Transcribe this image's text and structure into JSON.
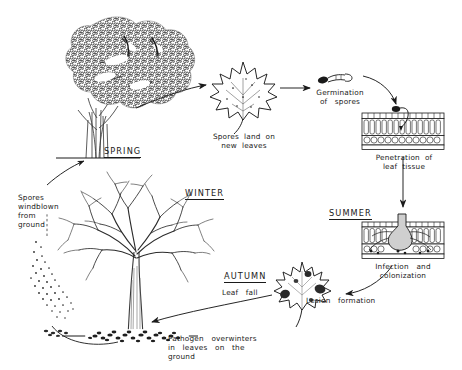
{
  "diagram": {
    "colors": {
      "ink": "#1a1a1a",
      "background": "#ffffff",
      "foliage": "#2b2b2b",
      "lesion": "#303030"
    }
  },
  "seasons": [
    {
      "id": "spring",
      "label": "SPRING"
    },
    {
      "id": "summer",
      "label": "SUMMER"
    },
    {
      "id": "autumn",
      "label": "AUTUMN"
    },
    {
      "id": "winter",
      "label": "WINTER"
    }
  ],
  "stages": [
    {
      "id": "spores-windblown",
      "label": "Spores\nwindblown\nfrom\nground",
      "icon": "spore-cloud-icon"
    },
    {
      "id": "spores-land",
      "label": "Spores  land  on\nnew  leaves",
      "icon": "healthy-leaf-icon"
    },
    {
      "id": "germination",
      "label": "Germination\nof   spores",
      "icon": "germinating-spore-icon"
    },
    {
      "id": "penetration",
      "label": "Penetration  of\nleaf  tissue",
      "icon": "leaf-cross-section-icon"
    },
    {
      "id": "infection",
      "label": "Infection   and\ncolonization",
      "icon": "infected-tissue-icon"
    },
    {
      "id": "lesion-formation",
      "label": "Lesion   formation",
      "icon": "lesioned-leaf-icon"
    },
    {
      "id": "leaf-fall",
      "label": "Leaf   fall",
      "icon": "falling-leaf-arrow-icon"
    },
    {
      "id": "overwintering",
      "label": "Pathogen   overwinters\nin   leaves   on   the\nground",
      "icon": "leaf-litter-icon"
    }
  ],
  "illustrations": [
    {
      "id": "spring-tree",
      "name": "leafy-tree-icon"
    },
    {
      "id": "winter-tree",
      "name": "bare-tree-icon"
    }
  ]
}
